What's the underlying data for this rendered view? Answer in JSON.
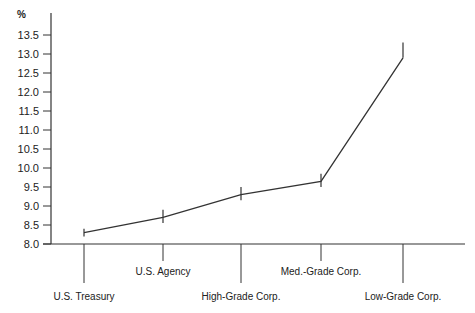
{
  "chart_data": {
    "type": "line",
    "title": "",
    "xlabel": "",
    "ylabel": "%",
    "ylim": [
      8.0,
      13.5
    ],
    "yticks": [
      "8.0",
      "8.5",
      "9.0",
      "9.5",
      "10.0",
      "10.5",
      "11.0",
      "11.5",
      "12.0",
      "12.5",
      "13.0",
      "13.5"
    ],
    "categories": [
      "U.S. Treasury",
      "U.S. Agency",
      "High-Grade Corp.",
      "Med.-Grade Corp.",
      "Low-Grade Corp."
    ],
    "values": [
      8.3,
      8.7,
      9.3,
      9.65,
      12.9
    ],
    "range_bars": [
      {
        "low": 8.2,
        "high": 8.4
      },
      {
        "low": 8.55,
        "high": 8.9
      },
      {
        "low": 9.15,
        "high": 9.5
      },
      {
        "low": 9.5,
        "high": 9.85
      },
      {
        "low": 12.9,
        "high": 13.3
      }
    ],
    "grid": false,
    "legend": null,
    "line_color": "#333333"
  }
}
